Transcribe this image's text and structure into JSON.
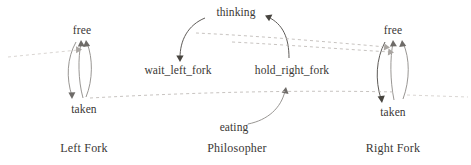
{
  "diagram": {
    "background_color": "#ffffff",
    "text_color": "#3a3734",
    "edge_color": "#8d8a87",
    "sync_edge_color": "#b9b4b0",
    "groups": [
      {
        "id": "left-fork",
        "label": "Left Fork",
        "states": [
          {
            "id": "left-free",
            "label": "free"
          },
          {
            "id": "left-taken",
            "label": "taken"
          }
        ]
      },
      {
        "id": "philosopher",
        "label": "Philosopher",
        "states": [
          {
            "id": "thinking",
            "label": "thinking"
          },
          {
            "id": "wait-left-fork",
            "label": "wait_left_fork"
          },
          {
            "id": "hold-right-fork",
            "label": "hold_right_fork"
          },
          {
            "id": "eating",
            "label": "eating"
          }
        ]
      },
      {
        "id": "right-fork",
        "label": "Right Fork",
        "states": [
          {
            "id": "right-free",
            "label": "free"
          },
          {
            "id": "right-taken",
            "label": "taken"
          }
        ]
      }
    ],
    "transitions": [
      {
        "from": "thinking",
        "to": "wait-left-fork"
      },
      {
        "from": "hold-right-fork",
        "to": "thinking"
      },
      {
        "from": "eating",
        "to": "hold-right-fork"
      },
      {
        "from": "left-free",
        "to": "left-taken"
      },
      {
        "from": "left-taken",
        "to": "left-free"
      },
      {
        "from": "right-free",
        "to": "right-taken"
      },
      {
        "from": "right-taken",
        "to": "right-free"
      }
    ]
  }
}
